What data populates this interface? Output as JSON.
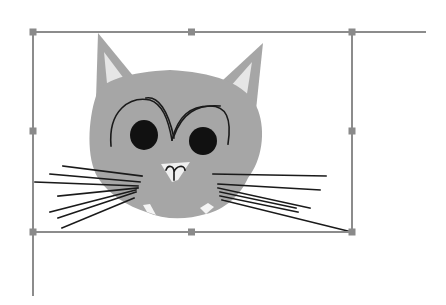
{
  "canvas": {
    "width": 446,
    "height": 305,
    "background": "#ffffff"
  },
  "object": {
    "type": "clip-art-image",
    "subject": "cartoon gray cat face with whiskers",
    "selected": true
  },
  "selection": {
    "box": {
      "left": 33,
      "top": 32,
      "right": 352,
      "bottom": 232
    },
    "handle_color": "#8a8a8a",
    "line_color": "#8c8c8c",
    "handles": [
      "top-left",
      "top-middle",
      "top-right",
      "middle-left",
      "middle-right",
      "bottom-left",
      "bottom-middle",
      "bottom-right"
    ]
  },
  "colors": {
    "fur": "#a6a6a6",
    "ear_inner": "#e6e6e6",
    "outline": "#1a1a1a",
    "eyes": "#111111"
  }
}
